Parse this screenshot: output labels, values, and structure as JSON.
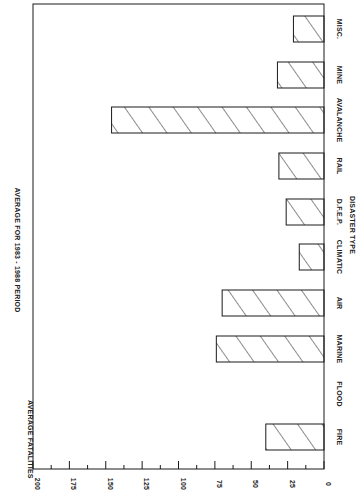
{
  "chart_data": {
    "type": "bar",
    "orientation": "rotated-90-clockwise",
    "title": "AVERAGE FOR 1983 - 1988 PERIOD",
    "xlabel": "DISASTER TYPE",
    "ylabel": "AVERAGE FATALITIES",
    "categories": [
      "FIRE",
      "FLOOD",
      "MARINE",
      "AIR",
      "CLIMATIC",
      "D.F.E.P.",
      "RAIL",
      "AVALANCHE",
      "MINE",
      "MISC."
    ],
    "values": [
      40,
      0,
      74,
      70,
      17,
      26,
      31,
      146,
      32,
      21
    ],
    "ylim": [
      0,
      200
    ],
    "yticks": [
      "0",
      "25",
      "50",
      "75",
      "100",
      "125",
      "150",
      "175",
      "200"
    ],
    "minor_tick_step": 12.5,
    "grid": false,
    "legend": null,
    "bar_fill": "diagonal-hatch",
    "colors": {
      "line": "#1a1a1a",
      "background": "#ffffff"
    }
  }
}
